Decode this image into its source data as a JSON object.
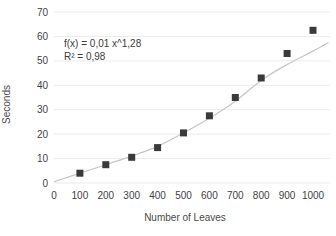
{
  "chart_data": {
    "type": "scatter",
    "title": "",
    "xlabel": "Number of Leaves",
    "ylabel": "Seconds",
    "x": [
      100,
      200,
      300,
      400,
      500,
      600,
      700,
      800,
      900,
      1000
    ],
    "values": [
      4,
      7.5,
      10.5,
      14.5,
      20.5,
      27.5,
      35,
      43,
      53,
      62.5
    ],
    "series_name": "Seconds vs Number of Leaves",
    "xlim": [
      0,
      1000
    ],
    "ylim": [
      0,
      70
    ],
    "x_ticks": [
      "0",
      "100",
      "200",
      "300",
      "400",
      "500",
      "600",
      "700",
      "800",
      "900",
      "1000"
    ],
    "y_ticks": [
      "0",
      "10",
      "20",
      "30",
      "40",
      "50",
      "60",
      "70"
    ],
    "grid": "horizontal-only",
    "legend": "none",
    "marker": "filled-square",
    "annotation": {
      "equation": "f(x) = 0,01 x^1,28",
      "r_squared": "R² = 0,98"
    },
    "trendline": {
      "type": "power",
      "points": [
        [
          0,
          0.5
        ],
        [
          100,
          4
        ],
        [
          200,
          7.5
        ],
        [
          300,
          11
        ],
        [
          400,
          15
        ],
        [
          500,
          20.5
        ],
        [
          600,
          26.5
        ],
        [
          700,
          33.5
        ],
        [
          800,
          42
        ],
        [
          900,
          48.5
        ],
        [
          1000,
          54
        ],
        [
          1060,
          57.5
        ]
      ]
    },
    "colors": {
      "marker": "#3a3a3a",
      "trendline": "#c6c6c6",
      "gridline": "#ebebeb",
      "tick_text": "#3f3f3f",
      "background": "#ffffff"
    }
  }
}
